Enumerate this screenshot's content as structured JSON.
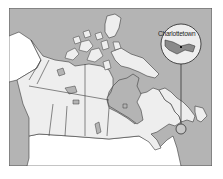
{
  "map": {
    "title": "Map of Canada",
    "inset": {
      "label": "Charlottetown",
      "description": "Locator inset of Prince Edward Island"
    },
    "colors": {
      "water": "#b4b4b4",
      "land_canada": "#eeeeee",
      "land_usa": "#ffffff",
      "border": "#3a3a3a",
      "frame": "#555555"
    }
  },
  "caption": {
    "text": ""
  }
}
